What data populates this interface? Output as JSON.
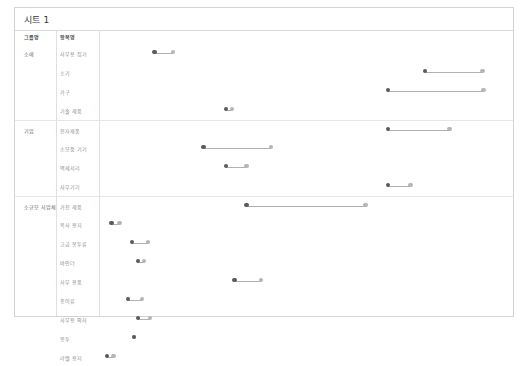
{
  "sheet": {
    "title": "시트 1"
  },
  "colors": {
    "frame_border": "#d4d4d4",
    "rule": "#e6e6e6",
    "dot_start": "#5a5a5a",
    "dot_end": "#b5b5b5",
    "link": "#b0b0b0",
    "header_text": "#4a4a4a",
    "label_text": "#8a8a8a"
  },
  "columns": {
    "group_header": "그룹명",
    "item_header": "항목명"
  },
  "chart_data": {
    "type": "scatter",
    "subtype": "dumbbell",
    "title": "시트 1",
    "xlabel": "",
    "ylabel": "",
    "grid": false,
    "legend": null,
    "xlim": [
      0,
      100
    ],
    "series": [
      {
        "name": "시작값",
        "color": "#5a5a5a"
      },
      {
        "name": "종료값",
        "color": "#b5b5b5"
      }
    ],
    "groups": [
      {
        "group": "소매",
        "rows": [
          {
            "item": "사무용 집기",
            "start": 13.5,
            "end": 18.0
          },
          {
            "item": "소기",
            "start": 79.5,
            "end": 93.5
          },
          {
            "item": "가구",
            "start": 70.5,
            "end": 93.8
          },
          {
            "item": "기술 제품",
            "start": 31.0,
            "end": 32.5
          }
        ]
      },
      {
        "group": "기업",
        "rows": [
          {
            "item": "전자제품",
            "start": 70.5,
            "end": 85.5
          },
          {
            "item": "소모품 기기",
            "start": 25.5,
            "end": 42.0
          },
          {
            "item": "액세서리",
            "start": 31.0,
            "end": 36.0
          },
          {
            "item": "사무기기",
            "start": 70.5,
            "end": 76.0
          }
        ]
      },
      {
        "group": "소규모 사업체",
        "rows": [
          {
            "item": "가전 제품",
            "start": 36.0,
            "end": 65.0
          },
          {
            "item": "복사 용지",
            "start": 3.0,
            "end": 5.0
          },
          {
            "item": "고급 봉투류",
            "start": 8.0,
            "end": 12.0
          },
          {
            "item": "바인더",
            "start": 9.5,
            "end": 11.0
          },
          {
            "item": "사무 용품",
            "start": 33.0,
            "end": 39.5
          },
          {
            "item": "종이류",
            "start": 7.0,
            "end": 10.5
          },
          {
            "item": "사무용 의자",
            "start": 9.5,
            "end": 12.5
          },
          {
            "item": "봉투",
            "start": 8.5,
            "end": 8.5
          },
          {
            "item": "라벨 용지",
            "start": 2.0,
            "end": 3.5
          }
        ]
      }
    ]
  }
}
